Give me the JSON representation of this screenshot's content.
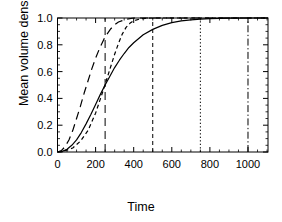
{
  "chart_data": {
    "type": "line",
    "title": "",
    "xlabel": "Time",
    "ylabel": "Mean volume density",
    "xlim": [
      0,
      1105
    ],
    "ylim": [
      0,
      1.0
    ],
    "xticks": [
      0,
      200,
      400,
      600,
      800,
      1000
    ],
    "xticklabels": [
      "0",
      "200",
      "400",
      "600",
      "800",
      "1000"
    ],
    "yticks": [
      0.0,
      0.2,
      0.4,
      0.6,
      0.8,
      1.0
    ],
    "yticklabels": [
      "0.0",
      "0.2",
      "0.4",
      "0.6",
      "0.8",
      "1.0"
    ],
    "grid": false,
    "legend": "none",
    "series": [
      {
        "name": "long-dashed-curve",
        "style": "dashed-long",
        "color": "#000000",
        "x": [
          0,
          20,
          40,
          60,
          80,
          100,
          120,
          140,
          160,
          180,
          200,
          220,
          240,
          250,
          260,
          280,
          300,
          320,
          340,
          360,
          400,
          500,
          700,
          900,
          1105
        ],
        "y": [
          0.0,
          0.01,
          0.04,
          0.09,
          0.16,
          0.25,
          0.34,
          0.44,
          0.53,
          0.62,
          0.7,
          0.77,
          0.83,
          0.86,
          0.88,
          0.92,
          0.95,
          0.97,
          0.98,
          0.99,
          1.0,
          1.0,
          1.0,
          1.0,
          1.0
        ]
      },
      {
        "name": "short-dashed-curve",
        "style": "dashed-short",
        "color": "#000000",
        "x": [
          0,
          40,
          80,
          120,
          160,
          200,
          240,
          260,
          280,
          300,
          320,
          340,
          360,
          380,
          400,
          440,
          500,
          600,
          800,
          1105
        ],
        "y": [
          0.0,
          0.01,
          0.03,
          0.08,
          0.16,
          0.29,
          0.46,
          0.55,
          0.64,
          0.73,
          0.81,
          0.88,
          0.93,
          0.96,
          0.98,
          0.995,
          1.0,
          1.0,
          1.0,
          1.0
        ]
      },
      {
        "name": "solid-curve",
        "style": "solid",
        "color": "#000000",
        "x": [
          0,
          25,
          50,
          75,
          100,
          125,
          150,
          175,
          200,
          225,
          250,
          275,
          300,
          325,
          350,
          375,
          400,
          450,
          500,
          550,
          600,
          650,
          700,
          750,
          800,
          900,
          1000,
          1105
        ],
        "y": [
          0.0,
          0.005,
          0.02,
          0.05,
          0.09,
          0.145,
          0.21,
          0.28,
          0.355,
          0.43,
          0.5,
          0.565,
          0.63,
          0.685,
          0.735,
          0.78,
          0.815,
          0.875,
          0.915,
          0.945,
          0.965,
          0.978,
          0.986,
          0.992,
          0.995,
          0.999,
          1.0,
          1.0
        ]
      }
    ],
    "vlines": [
      {
        "name": "vline-250",
        "x": 250,
        "style": "dashed-long",
        "color": "#000000"
      },
      {
        "name": "vline-500",
        "x": 500,
        "style": "dashed-short",
        "color": "#000000"
      },
      {
        "name": "vline-750",
        "x": 750,
        "style": "dotted",
        "color": "#000000"
      },
      {
        "name": "vline-1000",
        "x": 1000,
        "style": "dash-dot",
        "color": "#000000"
      }
    ]
  },
  "axes": {
    "x_axis_label": "Time",
    "y_axis_label": "Mean volume density"
  }
}
